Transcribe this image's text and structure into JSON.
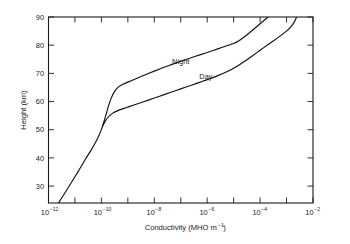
{
  "chart_data": {
    "type": "line",
    "title": "",
    "xlabel": "Conductivity (MHO m⁻¹)",
    "xlabel_base": "Conductivity (MHO m",
    "xlabel_exp": "-1",
    "xlabel_tail": ")",
    "ylabel": "Height (km)",
    "xscale": "log",
    "yscale": "linear",
    "xlim": [
      1e-12,
      0.01
    ],
    "ylim": [
      24,
      90
    ],
    "grid": false,
    "legend_position": "inline-annotation",
    "xticks": [
      {
        "exponent": -12,
        "label": "10",
        "exp": "-12",
        "labeled": true
      },
      {
        "exponent": -11,
        "label": "",
        "exp": "",
        "labeled": false
      },
      {
        "exponent": -10,
        "label": "10",
        "exp": "-10",
        "labeled": true
      },
      {
        "exponent": -9,
        "label": "",
        "exp": "",
        "labeled": false
      },
      {
        "exponent": -8,
        "label": "10",
        "exp": "-8",
        "labeled": true
      },
      {
        "exponent": -7,
        "label": "",
        "exp": "",
        "labeled": false
      },
      {
        "exponent": -6,
        "label": "10",
        "exp": "-6",
        "labeled": true
      },
      {
        "exponent": -5,
        "label": "",
        "exp": "",
        "labeled": false
      },
      {
        "exponent": -4,
        "label": "10",
        "exp": "-4",
        "labeled": true
      },
      {
        "exponent": -3,
        "label": "",
        "exp": "",
        "labeled": false
      },
      {
        "exponent": -2,
        "label": "10",
        "exp": "-2",
        "labeled": true
      }
    ],
    "yticks": [
      30,
      40,
      50,
      60,
      70,
      80,
      90
    ],
    "series": [
      {
        "name": "Night",
        "annotation": "Night",
        "color": "#111111",
        "points": [
          [
            -11.62,
            24.0
          ],
          [
            -11.4,
            27.3
          ],
          [
            -11.2,
            30.3
          ],
          [
            -11.0,
            33.3
          ],
          [
            -10.8,
            36.4
          ],
          [
            -10.6,
            39.6
          ],
          [
            -10.4,
            42.6
          ],
          [
            -10.25,
            45.0
          ],
          [
            -10.12,
            47.4
          ],
          [
            -10.02,
            49.6
          ],
          [
            -9.95,
            51.4
          ],
          [
            -9.88,
            53.6
          ],
          [
            -9.8,
            56.2
          ],
          [
            -9.72,
            58.8
          ],
          [
            -9.62,
            61.4
          ],
          [
            -9.5,
            63.6
          ],
          [
            -9.35,
            65.2
          ],
          [
            -9.15,
            66.3
          ],
          [
            -8.9,
            67.3
          ],
          [
            -8.5,
            68.9
          ],
          [
            -8.0,
            70.8
          ],
          [
            -7.5,
            72.6
          ],
          [
            -7.0,
            74.3
          ],
          [
            -6.5,
            75.9
          ],
          [
            -6.0,
            77.4
          ],
          [
            -5.6,
            78.7
          ],
          [
            -5.25,
            79.8
          ],
          [
            -5.0,
            80.6
          ],
          [
            -4.8,
            81.6
          ],
          [
            -4.6,
            82.9
          ],
          [
            -4.4,
            84.4
          ],
          [
            -4.2,
            86.0
          ],
          [
            -4.0,
            87.6
          ],
          [
            -3.8,
            89.2
          ],
          [
            -3.7,
            90.0
          ]
        ]
      },
      {
        "name": "Day",
        "annotation": "Day",
        "color": "#111111",
        "points": [
          [
            -9.95,
            51.4
          ],
          [
            -9.88,
            52.6
          ],
          [
            -9.8,
            53.8
          ],
          [
            -9.7,
            54.9
          ],
          [
            -9.58,
            55.8
          ],
          [
            -9.42,
            56.6
          ],
          [
            -9.2,
            57.4
          ],
          [
            -8.95,
            58.2
          ],
          [
            -8.6,
            59.3
          ],
          [
            -8.2,
            60.6
          ],
          [
            -7.8,
            61.9
          ],
          [
            -7.4,
            63.2
          ],
          [
            -7.0,
            64.5
          ],
          [
            -6.6,
            65.8
          ],
          [
            -6.2,
            67.1
          ],
          [
            -5.9,
            68.1
          ],
          [
            -5.6,
            69.2
          ],
          [
            -5.3,
            70.4
          ],
          [
            -5.0,
            71.8
          ],
          [
            -4.75,
            73.2
          ],
          [
            -4.5,
            74.8
          ],
          [
            -4.25,
            76.5
          ],
          [
            -4.0,
            78.2
          ],
          [
            -3.75,
            79.9
          ],
          [
            -3.5,
            81.5
          ],
          [
            -3.25,
            83.2
          ],
          [
            -3.0,
            85.0
          ],
          [
            -2.85,
            86.4
          ],
          [
            -2.72,
            88.0
          ],
          [
            -2.62,
            90.0
          ]
        ]
      }
    ],
    "annotations": [
      {
        "text": "Night",
        "x": -7.0,
        "y": 73.2
      },
      {
        "text": "Day",
        "x": -6.05,
        "y": 68.0
      }
    ]
  }
}
